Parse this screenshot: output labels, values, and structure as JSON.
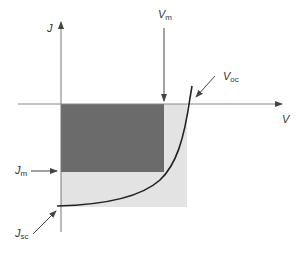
{
  "diagram": {
    "axes": {
      "y_label": "J",
      "x_label": "V"
    },
    "labels": {
      "vm": {
        "main": "V",
        "sub": "m"
      },
      "voc": {
        "main": "V",
        "sub": "oc"
      },
      "jm": {
        "main": "J",
        "sub": "m"
      },
      "jsc": {
        "main": "J",
        "sub": "sc"
      }
    },
    "regions": {
      "max_power": {
        "name": "Vm x Jm rectangle",
        "color": "#6b6b6b"
      },
      "ideal": {
        "name": "Voc x Jsc rectangle",
        "color": "#e3e3e3"
      }
    },
    "colors": {
      "axis": "#777777",
      "curve": "#222222",
      "text": "#333333"
    }
  }
}
